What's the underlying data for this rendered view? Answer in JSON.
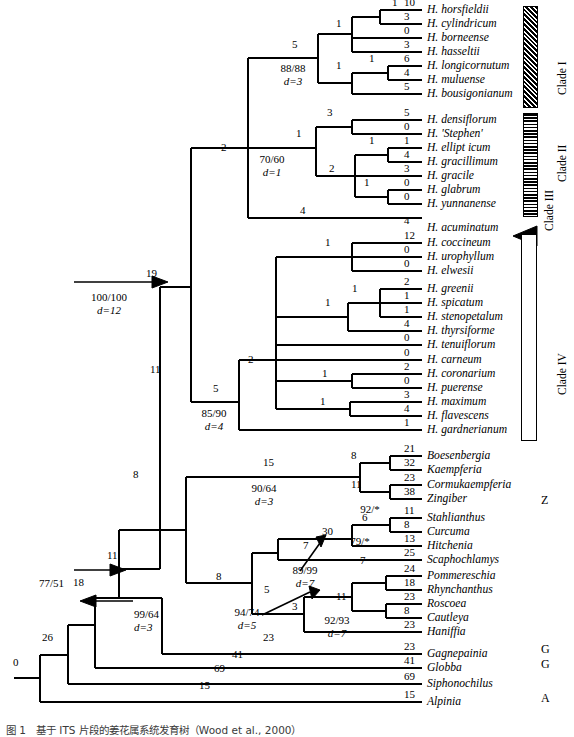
{
  "figure": {
    "caption": "图 1　基于 ITS 片段的姜花属系统发育树（Wood et al., 2000）"
  },
  "taxa": [
    {
      "name": "H. horsfieldii",
      "branch": "10",
      "y": 10
    },
    {
      "name": "H. cylindricum",
      "branch": "3",
      "y": 24
    },
    {
      "name": "H. borneense",
      "branch": "0",
      "y": 38
    },
    {
      "name": "H. hasseltii",
      "branch": "3",
      "y": 52
    },
    {
      "name": "H. longicornutum",
      "branch": "6",
      "y": 66
    },
    {
      "name": "H. muluense",
      "branch": "4",
      "y": 80
    },
    {
      "name": "H. bousigonianum",
      "branch": "5",
      "y": 94
    },
    {
      "name": "H. densiflorum",
      "branch": "5",
      "y": 120
    },
    {
      "name": "H. 'Stephen'",
      "branch": "0",
      "y": 134
    },
    {
      "name": "H. ellipt icum",
      "branch": "1",
      "y": 148
    },
    {
      "name": "H. gracillimum",
      "branch": "4",
      "y": 162
    },
    {
      "name": "H. gracile",
      "branch": "3",
      "y": 176
    },
    {
      "name": "H. glabrum",
      "branch": "0",
      "y": 190
    },
    {
      "name": "H. yunnanense",
      "branch": "0",
      "y": 204
    },
    {
      "name": "H. acuminatum",
      "branch": "4",
      "y": 228
    },
    {
      "name": "H. coccineum",
      "branch": "12",
      "y": 243
    },
    {
      "name": "H. urophyllum",
      "branch": "0",
      "y": 257
    },
    {
      "name": "H. elwesii",
      "branch": "0",
      "y": 271
    },
    {
      "name": "H. greenii",
      "branch": "2",
      "y": 289
    },
    {
      "name": "H. spicatum",
      "branch": "1",
      "y": 303
    },
    {
      "name": "H. stenopetalum",
      "branch": "1",
      "y": 317
    },
    {
      "name": "H. thyrsiforme",
      "branch": "4",
      "y": 331
    },
    {
      "name": "H. tenuiflorum",
      "branch": "0",
      "y": 345
    },
    {
      "name": "H. carneum",
      "branch": "0",
      "y": 360
    },
    {
      "name": "H. coronarium",
      "branch": "2",
      "y": 374
    },
    {
      "name": "H. puerense",
      "branch": "0",
      "y": 388
    },
    {
      "name": "H. maximum",
      "branch": "3",
      "y": 402
    },
    {
      "name": "H. flavescens",
      "branch": "4",
      "y": 416
    },
    {
      "name": "H. gardnerianum",
      "branch": "1",
      "y": 430
    },
    {
      "name": "Boesenbergia",
      "branch": "21",
      "y": 456
    },
    {
      "name": "Kaempferia",
      "branch": "32",
      "y": 470
    },
    {
      "name": "Cormukaempferia",
      "branch": "23",
      "y": 485
    },
    {
      "name": "Zingiber",
      "branch": "38",
      "y": 499
    },
    {
      "name": "Stahlianthus",
      "branch": "11",
      "y": 518
    },
    {
      "name": "Curcuma",
      "branch": "8",
      "y": 532
    },
    {
      "name": "Hitchenia",
      "branch": "13",
      "y": 546
    },
    {
      "name": "Scaphochlamys",
      "branch": "25",
      "y": 560
    },
    {
      "name": "Pommereschia",
      "branch": "24",
      "y": 576
    },
    {
      "name": "Rhynchanthus",
      "branch": "18",
      "y": 590
    },
    {
      "name": "Roscoea",
      "branch": "23",
      "y": 604
    },
    {
      "name": "Cautleya",
      "branch": "8",
      "y": 618
    },
    {
      "name": "Haniffia",
      "branch": "23",
      "y": 632
    },
    {
      "name": "Gagnepainia",
      "branch": "23",
      "y": 654
    },
    {
      "name": "Globba",
      "branch": "41",
      "y": 668
    },
    {
      "name": "Siphonochilus",
      "branch": "69",
      "y": 684
    },
    {
      "name": "Alpinia",
      "branch": "15",
      "y": 702
    }
  ],
  "internal_branch_labels": [
    {
      "value": "1",
      "x": 392,
      "y": 10
    },
    {
      "value": "1",
      "x": 336,
      "y": 31
    },
    {
      "value": "5",
      "x": 292,
      "y": 52
    },
    {
      "value": "1",
      "x": 336,
      "y": 73
    },
    {
      "value": "1",
      "x": 369,
      "y": 66
    },
    {
      "value": "3",
      "x": 327,
      "y": 120
    },
    {
      "value": "1",
      "x": 296,
      "y": 141
    },
    {
      "value": "1",
      "x": 369,
      "y": 148
    },
    {
      "value": "2",
      "x": 329,
      "y": 176
    },
    {
      "value": "1",
      "x": 364,
      "y": 190
    },
    {
      "value": "2",
      "x": 221,
      "y": 155
    },
    {
      "value": "4",
      "x": 300,
      "y": 218
    },
    {
      "value": "1",
      "x": 325,
      "y": 250
    },
    {
      "value": "1",
      "x": 352,
      "y": 296
    },
    {
      "value": "1",
      "x": 325,
      "y": 310
    },
    {
      "value": "1",
      "x": 322,
      "y": 381
    },
    {
      "value": "1",
      "x": 320,
      "y": 409
    },
    {
      "value": "2",
      "x": 248,
      "y": 367
    },
    {
      "value": "5",
      "x": 213,
      "y": 396
    },
    {
      "value": "19",
      "x": 146,
      "y": 281
    },
    {
      "value": "11",
      "x": 150,
      "y": 377
    },
    {
      "value": "8",
      "x": 133,
      "y": 482
    },
    {
      "value": "15",
      "x": 263,
      "y": 470
    },
    {
      "value": "8",
      "x": 351,
      "y": 463
    },
    {
      "value": "11",
      "x": 351,
      "y": 492
    },
    {
      "value": "6",
      "x": 362,
      "y": 525
    },
    {
      "value": "30",
      "x": 322,
      "y": 539
    },
    {
      "value": "7",
      "x": 303,
      "y": 553
    },
    {
      "value": "8",
      "x": 216,
      "y": 584
    },
    {
      "value": "7",
      "x": 360,
      "y": 568
    },
    {
      "value": "5",
      "x": 264,
      "y": 597
    },
    {
      "value": "11",
      "x": 336,
      "y": 604
    },
    {
      "value": "3",
      "x": 292,
      "y": 614
    },
    {
      "value": "11",
      "x": 107,
      "y": 563
    },
    {
      "value": "18",
      "x": 73,
      "y": 590
    },
    {
      "value": "26",
      "x": 42,
      "y": 645
    },
    {
      "value": "0",
      "x": 13,
      "y": 670
    },
    {
      "value": "23",
      "x": 263,
      "y": 645
    },
    {
      "value": "41",
      "x": 232,
      "y": 662
    },
    {
      "value": "69",
      "x": 214,
      "y": 676
    },
    {
      "value": "15",
      "x": 199,
      "y": 693
    }
  ],
  "support_labels": [
    {
      "bs": "88/88",
      "d": "d=3",
      "x": 293,
      "y": 62,
      "align": "center"
    },
    {
      "bs": "70/60",
      "d": "d=1",
      "x": 272,
      "y": 153,
      "align": "center"
    },
    {
      "bs": "100/100",
      "d": "d=12",
      "x": 109,
      "y": 291,
      "align": "center"
    },
    {
      "bs": "85/90",
      "d": "d=4",
      "x": 214,
      "y": 407,
      "align": "center"
    },
    {
      "bs": "90/64",
      "d": "d=3",
      "x": 264,
      "y": 482,
      "align": "center"
    },
    {
      "bs": "92/*",
      "d": "",
      "x": 370,
      "y": 503,
      "align": "center"
    },
    {
      "bs": "79/*",
      "d": "",
      "x": 360,
      "y": 535,
      "align": "center"
    },
    {
      "bs": "89/99",
      "d": "d=7",
      "x": 305,
      "y": 564,
      "align": "center"
    },
    {
      "bs": "94/74",
      "d": "d=5",
      "x": 247,
      "y": 606,
      "align": "center"
    },
    {
      "bs": "92/93",
      "d": "d=7",
      "x": 337,
      "y": 614,
      "align": "center"
    },
    {
      "bs": "77/51",
      "d": "",
      "x": 39,
      "y": 577,
      "align": "left"
    },
    {
      "bs": "99/64",
      "d": "d=3",
      "x": 134,
      "y": 608,
      "align": "left"
    }
  ],
  "clade_labels": [
    {
      "label": "Clade I",
      "x": 556,
      "y": 95
    },
    {
      "label": "Clade II",
      "x": 556,
      "y": 182
    },
    {
      "label": "Clade III",
      "x": 543,
      "y": 231
    },
    {
      "label": "Clade IV",
      "x": 556,
      "y": 395
    }
  ],
  "group_letters": [
    {
      "label": "Z",
      "x": 541,
      "y": 500
    },
    {
      "label": "G",
      "x": 541,
      "y": 649
    },
    {
      "label": "G",
      "x": 541,
      "y": 664
    },
    {
      "label": "A",
      "x": 541,
      "y": 698
    }
  ],
  "clade_bars": [
    {
      "name": "clade-1-bar",
      "style": "diagonal-hatch",
      "x": 523,
      "y": 6,
      "w": 13,
      "h": 100
    },
    {
      "name": "clade-2-bar",
      "style": "horizontal-stripe",
      "x": 523,
      "y": 113,
      "w": 13,
      "h": 102
    },
    {
      "name": "clade-4-bar",
      "style": "outline",
      "x": 521,
      "y": 234,
      "w": 14,
      "h": 205
    }
  ],
  "colors": {
    "ink": "#000000",
    "caption": "#3a3a3a"
  }
}
